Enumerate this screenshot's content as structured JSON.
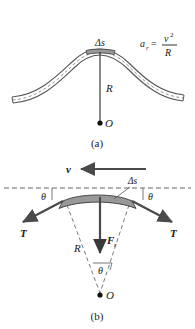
{
  "figure": {
    "colors": {
      "arc_fill": "#999999",
      "arc_stroke": "#3a3a3a",
      "line": "#2b2b2b",
      "dashed": "#555555",
      "background": "#ffffff",
      "road_fill": "#f2f2f2"
    }
  },
  "panel_a": {
    "caption": "(a)",
    "labels": {
      "delta_s": "Δs",
      "radius": "R",
      "center": "O"
    },
    "equation": {
      "lhs_symbol": "a",
      "lhs_subscript": "r",
      "equals": "=",
      "numerator_symbol": "v",
      "numerator_exponent": "2",
      "denominator": "R",
      "full_text": "a_r = v²/R"
    },
    "elements": {
      "road_name": "curved road ribbon with dashed centerline",
      "highlight_name": "delta-s arc highlight at crest",
      "radius_line_name": "radius line from crest to center O",
      "center_dot_name": "center point O"
    }
  },
  "panel_b": {
    "caption": "(b)",
    "labels": {
      "velocity": "v",
      "delta_s": "Δs",
      "tension_left": "T",
      "tension_right": "T",
      "angle_left": "θ",
      "angle_right": "θ",
      "angle_center": "θ",
      "radius": "R",
      "force_symbol": "F",
      "force_subscript": "r",
      "center": "O"
    },
    "elements": {
      "velocity_arrow_name": "velocity vector arrow pointing left",
      "horizontal_dashed_name": "horizontal dashed reference line",
      "arc_name": "gray curved segment delta-s",
      "tension_left_name": "tension vector left",
      "tension_right_name": "tension vector right",
      "force_arrow_name": "radial force vector F_r pointing down",
      "radius_dashed_left_name": "dashed radius line left",
      "radius_dashed_right_name": "dashed radius line right",
      "center_dot_name": "center point O"
    }
  }
}
